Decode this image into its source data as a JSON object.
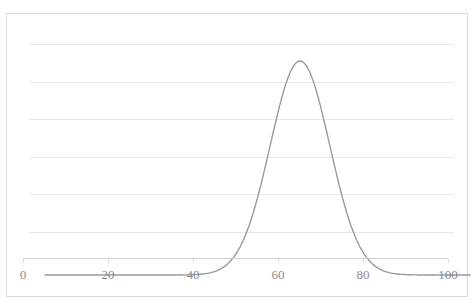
{
  "chart_data": {
    "type": "line",
    "title": "",
    "subtitle": "",
    "xlabel": "",
    "ylabel": "",
    "xlim": [
      0,
      100
    ],
    "ylim": [
      0,
      0.07
    ],
    "grid": true,
    "legend": false,
    "legend_position": "none",
    "x_ticks": [
      {
        "value": 0,
        "label": "0"
      },
      {
        "value": 20,
        "label": "20"
      },
      {
        "value": 40,
        "label": "40"
      },
      {
        "value": 60,
        "label": "60"
      },
      {
        "value": 80,
        "label": "80"
      },
      {
        "value": 100,
        "label": "100"
      }
    ],
    "y_ticks": [],
    "y_gridlines": [
      0.01,
      0.02,
      0.03,
      0.04,
      0.05,
      0.06
    ],
    "series": [
      {
        "name": "normal-distribution",
        "type": "line",
        "color": "#9a9a9a",
        "line_width": 1.4,
        "marker": "none",
        "distribution": "normal",
        "mean": 60,
        "std_dev": 7,
        "peak_x": 60,
        "peak_y": 0.057,
        "x": [
          0,
          5,
          10,
          15,
          20,
          25,
          30,
          32,
          34,
          36,
          38,
          40,
          42,
          44,
          46,
          48,
          50,
          52,
          54,
          56,
          58,
          60,
          62,
          64,
          66,
          68,
          70,
          72,
          74,
          76,
          78,
          80,
          82,
          84,
          86,
          88,
          90,
          95,
          100
        ],
        "values": [
          0.0,
          0.0,
          0.0,
          0.0,
          0.0,
          0.0,
          0.0001,
          0.0002,
          0.0004,
          0.0008,
          0.0016,
          0.0029,
          0.0049,
          0.0079,
          0.0119,
          0.0171,
          0.0232,
          0.0298,
          0.0364,
          0.0424,
          0.0469,
          0.0492,
          0.0492,
          0.0469,
          0.0424,
          0.0364,
          0.0298,
          0.0232,
          0.0171,
          0.0119,
          0.0079,
          0.0049,
          0.0029,
          0.0016,
          0.0008,
          0.0004,
          0.0002,
          0.0,
          0.0
        ]
      }
    ],
    "annotations": []
  },
  "colors": {
    "curve": "#9a9a9a",
    "gridline": "#e8e8e8",
    "axis": "#d2d2d2",
    "frame_border": "#d9d9d9",
    "tick_label": "#8c8c8c",
    "background": "#ffffff"
  }
}
